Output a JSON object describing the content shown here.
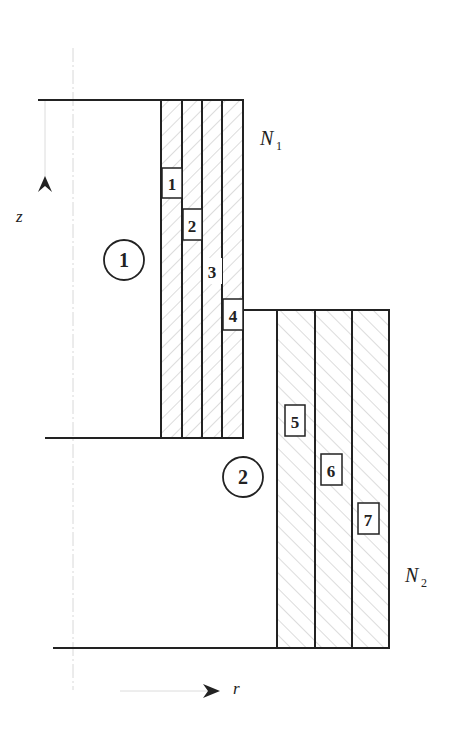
{
  "diagram": {
    "axes": {
      "z_label": "z",
      "r_label": "r"
    },
    "regions": [
      {
        "id": "region-1",
        "label": "1"
      },
      {
        "id": "region-2",
        "label": "2"
      }
    ],
    "coils": [
      {
        "id": "coil-N1",
        "name": "N",
        "subscript": "1"
      },
      {
        "id": "coil-N2",
        "name": "N",
        "subscript": "2"
      }
    ],
    "layers": [
      {
        "label": "1"
      },
      {
        "label": "2"
      },
      {
        "label": "3"
      },
      {
        "label": "4"
      },
      {
        "label": "5"
      },
      {
        "label": "6"
      },
      {
        "label": "7"
      }
    ],
    "colors": {
      "line": "#222222",
      "hatch": "#9a9a9a",
      "axis": "#cfcfcf"
    }
  }
}
